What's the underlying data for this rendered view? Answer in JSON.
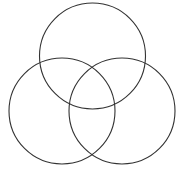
{
  "figure": {
    "name": "three-circle-venn-diagram",
    "type": "venn",
    "background_color": "#ffffff",
    "stroke_color": "#333333",
    "stroke_width": 1.1,
    "fill": "none",
    "caption": ""
  },
  "chart_data": {
    "type": "diagram",
    "subtype": "venn-3-set",
    "title": "",
    "subtitle": "",
    "xlabel": "",
    "ylabel": "",
    "grid": false,
    "legend": null,
    "canvas": {
      "width": 184,
      "height": 178,
      "units": "px"
    },
    "sets": [
      {
        "id": "top",
        "label": "",
        "center_x": 92.5,
        "center_y": 56,
        "radius": 53,
        "stroke": "#333333",
        "fill": "none"
      },
      {
        "id": "bottom-left",
        "label": "",
        "center_x": 62,
        "center_y": 111,
        "radius": 53,
        "stroke": "#333333",
        "fill": "none"
      },
      {
        "id": "bottom-right",
        "label": "",
        "center_x": 122,
        "center_y": 111,
        "radius": 53,
        "stroke": "#333333",
        "fill": "none"
      }
    ],
    "region_labels": [],
    "annotations": []
  }
}
